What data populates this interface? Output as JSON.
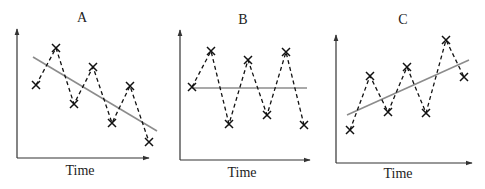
{
  "colors": {
    "axis": "#333333",
    "data_line": "#111111",
    "marker": "#111111",
    "trend_line": "#8c8c8c",
    "text": "#222222",
    "background": "#ffffff"
  },
  "panels": [
    {
      "title": "A",
      "xlabel": "Time",
      "trend": "decreasing"
    },
    {
      "title": "B",
      "xlabel": "Time",
      "trend": "flat"
    },
    {
      "title": "C",
      "xlabel": "Time",
      "trend": "increasing"
    }
  ],
  "chart_data": [
    {
      "type": "line",
      "title": "A",
      "xlabel": "Time",
      "ylabel": "",
      "marker": "x",
      "line_style": "dashed",
      "grid": false,
      "x": [
        1,
        2,
        3,
        4,
        5,
        6,
        7
      ],
      "series": [
        {
          "name": "observations",
          "values": [
            6.3,
            8.2,
            5.3,
            7.2,
            4.4,
            6.3,
            3.4
          ]
        },
        {
          "name": "trend",
          "values": [
            7.4,
            6.8,
            6.1,
            5.5,
            4.9,
            4.2,
            3.6
          ]
        }
      ]
    },
    {
      "type": "line",
      "title": "B",
      "xlabel": "Time",
      "ylabel": "",
      "marker": "x",
      "line_style": "dashed",
      "grid": false,
      "x": [
        1,
        2,
        3,
        4,
        5,
        6,
        7
      ],
      "series": [
        {
          "name": "observations",
          "values": [
            6.1,
            8.0,
            4.1,
            7.5,
            4.6,
            7.9,
            4.0
          ]
        },
        {
          "name": "trend",
          "values": [
            6.0,
            6.0,
            6.0,
            6.0,
            6.0,
            6.0,
            6.0
          ]
        }
      ]
    },
    {
      "type": "line",
      "title": "C",
      "xlabel": "Time",
      "ylabel": "",
      "marker": "x",
      "line_style": "dashed",
      "grid": false,
      "x": [
        1,
        2,
        3,
        4,
        5,
        6,
        7
      ],
      "series": [
        {
          "name": "observations",
          "values": [
            2.8,
            5.6,
            3.7,
            6.1,
            3.7,
            7.5,
            5.5
          ]
        },
        {
          "name": "trend",
          "values": [
            3.5,
            4.0,
            4.5,
            5.0,
            5.5,
            6.0,
            6.5
          ]
        }
      ]
    }
  ],
  "geometry": [
    {
      "axis": {
        "x0": 17,
        "ytop": 29,
        "ybot": 158,
        "xend": 149
      },
      "title_pos": [
        82,
        22
      ],
      "label_pos": [
        80,
        175
      ],
      "points": [
        [
          36,
          85
        ],
        [
          56,
          48
        ],
        [
          74,
          104
        ],
        [
          93,
          67
        ],
        [
          112,
          123
        ],
        [
          130,
          86
        ],
        [
          149,
          142
        ]
      ],
      "trend": [
        [
          33,
          57
        ],
        [
          157,
          131
        ]
      ]
    },
    {
      "axis": {
        "x0": 180,
        "ytop": 30,
        "ybot": 160,
        "xend": 310
      },
      "title_pos": [
        243,
        24
      ],
      "label_pos": [
        242,
        177
      ],
      "points": [
        [
          192,
          87
        ],
        [
          211,
          51
        ],
        [
          229,
          124
        ],
        [
          248,
          60
        ],
        [
          267,
          115
        ],
        [
          286,
          52
        ],
        [
          304,
          125
        ]
      ],
      "trend": [
        [
          192,
          88
        ],
        [
          307,
          88
        ]
      ]
    },
    {
      "axis": {
        "x0": 336,
        "ytop": 35,
        "ybot": 163,
        "xend": 472
      },
      "title_pos": [
        403,
        24
      ],
      "label_pos": [
        398,
        178
      ],
      "points": [
        [
          350,
          130
        ],
        [
          370,
          76
        ],
        [
          388,
          112
        ],
        [
          407,
          67
        ],
        [
          426,
          113
        ],
        [
          446,
          40
        ],
        [
          464,
          77
        ]
      ],
      "trend": [
        [
          347,
          115
        ],
        [
          469,
          60
        ]
      ]
    }
  ]
}
